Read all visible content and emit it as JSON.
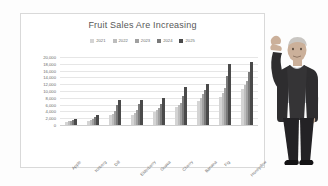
{
  "chart_data": {
    "type": "bar",
    "title": "Fruit Sales Are Increasing",
    "xlabel": "",
    "ylabel": "",
    "ylim": [
      0,
      20000
    ],
    "ytick_step": 2000,
    "grid": true,
    "legend_position": "top-center",
    "y_ticks": [
      "20,000",
      "18,000",
      "16,000",
      "14,000",
      "12,000",
      "10,000",
      "8,000",
      "6,000",
      "4,000",
      "2,000",
      "0"
    ],
    "categories": [
      "Apple",
      "Iceberg",
      "Dill",
      "Elderberry",
      "Guava",
      "Cherry",
      "Banana",
      "Fig",
      "Honeydew"
    ],
    "series": [
      {
        "name": "2021",
        "color": "#d4d4d4",
        "values": [
          900,
          1100,
          2900,
          3000,
          3900,
          5300,
          7000,
          8200,
          10600
        ]
      },
      {
        "name": "2022",
        "color": "#bdbdbd",
        "values": [
          1100,
          1400,
          3300,
          3600,
          4400,
          5800,
          8000,
          9300,
          11700
        ]
      },
      {
        "name": "2023",
        "color": "#a0a0a0",
        "values": [
          1300,
          1900,
          4100,
          4500,
          5000,
          6500,
          9100,
          10800,
          12900
        ]
      },
      {
        "name": "2024",
        "color": "#7a7a7a",
        "values": [
          1600,
          2400,
          5900,
          6100,
          6200,
          8400,
          10200,
          14500,
          15600
        ]
      },
      {
        "name": "2025",
        "color": "#4a4a4a",
        "values": [
          1900,
          3000,
          7400,
          7500,
          8000,
          11200,
          12100,
          17800,
          18600
        ]
      }
    ]
  },
  "legend": {
    "items": [
      {
        "label": "2021",
        "color": "#d4d4d4"
      },
      {
        "label": "2022",
        "color": "#bdbdbd"
      },
      {
        "label": "2023",
        "color": "#a0a0a0"
      },
      {
        "label": "2024",
        "color": "#7a7a7a"
      },
      {
        "label": "2025",
        "color": "#4a4a4a"
      }
    ]
  },
  "person": {
    "alt": "man in dark suit with raised fist",
    "suit_color": "#2e2d2f",
    "shirt_color": "#b9bcc0",
    "skin_color": "#cbb09a",
    "hair_color": "#c9c6c2"
  },
  "colors": {
    "background": "#fdfdfd",
    "chart_background": "#ffffff",
    "frame_border": "#d9d9d9",
    "title_text": "#585858",
    "axis_text": "#6a6a6a",
    "gridline": "#e6e6e6"
  }
}
